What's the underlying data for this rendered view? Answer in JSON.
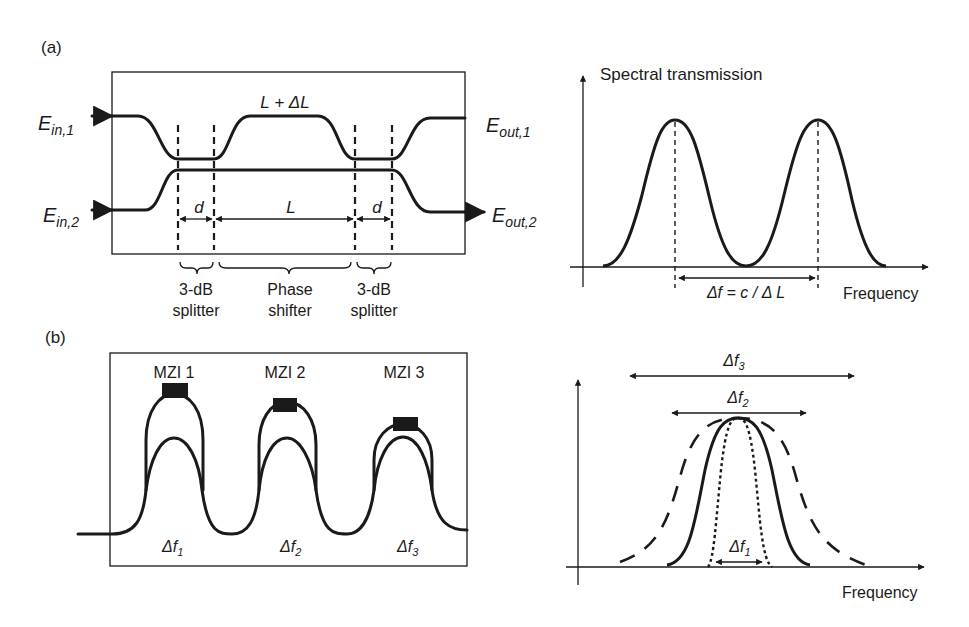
{
  "panel_a": {
    "label": "(a)",
    "mzi": {
      "inputs": [
        {
          "main": "E",
          "sub": "in,1"
        },
        {
          "main": "E",
          "sub": "in,2"
        }
      ],
      "outputs": [
        {
          "main": "E",
          "sub": "out,1"
        },
        {
          "main": "E",
          "sub": "out,2"
        }
      ],
      "upper_arm_label": "L + ΔL",
      "dimensions": {
        "d_left": "d",
        "L": "L",
        "d_right": "d"
      },
      "sections": [
        {
          "line1": "3-dB",
          "line2": "splitter"
        },
        {
          "line1": "Phase",
          "line2": "shifter"
        },
        {
          "line1": "3-dB",
          "line2": "splitter"
        }
      ]
    },
    "spectrum": {
      "ylabel": "Spectral transmission",
      "xlabel": "Frequency",
      "fsr_label": "Δf = c / Δ L"
    }
  },
  "panel_b": {
    "label": "(b)",
    "cascade": {
      "stages": [
        {
          "name": "MZI 1",
          "df_main": "Δf",
          "df_sub": "1"
        },
        {
          "name": "MZI 2",
          "df_main": "Δf",
          "df_sub": "2"
        },
        {
          "name": "MZI 3",
          "df_main": "Δf",
          "df_sub": "3"
        }
      ]
    },
    "spectrum": {
      "xlabel": "Frequency",
      "bandwidths": [
        {
          "main": "Δf",
          "sub": "3",
          "style": "long-dash",
          "role": "widest"
        },
        {
          "main": "Δf",
          "sub": "2",
          "style": "solid",
          "role": "middle"
        },
        {
          "main": "Δf",
          "sub": "1",
          "style": "dotted",
          "role": "narrowest"
        }
      ]
    }
  },
  "colors": {
    "ink": "#1a1a1a",
    "background": "#ffffff"
  }
}
